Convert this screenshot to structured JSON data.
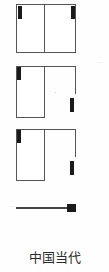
{
  "caption": {
    "text": "中国当代"
  },
  "colors": {
    "line": "#555555",
    "hardware": "#1a1a1a",
    "background": "#ffffff",
    "caption_text": "#2b2b2b"
  },
  "figures": [
    {
      "id": "figure-1",
      "kind": "double-leaf-frame",
      "label": "",
      "x": 16,
      "y": 4,
      "width": 60,
      "height": 49,
      "divider": true,
      "hardware": [
        {
          "name": "hinge-top-left",
          "x": 1,
          "y": 1,
          "width": 4,
          "height": 13
        },
        {
          "name": "hinge-top-right",
          "x": 54,
          "y": 1,
          "width": 4,
          "height": 13
        }
      ]
    },
    {
      "id": "figure-2",
      "kind": "single-leaf-open-right",
      "label": "",
      "x": 16,
      "y": 66,
      "width": 60,
      "height": 52,
      "divider": false,
      "hardware": [
        {
          "name": "hinge-top-left",
          "x": 1,
          "y": 1,
          "width": 4,
          "height": 13
        },
        {
          "name": "handle-mid-right",
          "x": 54,
          "y": 32,
          "width": 4,
          "height": 14
        }
      ]
    },
    {
      "id": "figure-3",
      "kind": "single-leaf-open-right",
      "label": "",
      "x": 16,
      "y": 129,
      "width": 60,
      "height": 52,
      "divider": false,
      "hardware": [
        {
          "name": "hinge-top-left",
          "x": 1,
          "y": 1,
          "width": 4,
          "height": 13
        },
        {
          "name": "handle-mid-right",
          "x": 54,
          "y": 32,
          "width": 4,
          "height": 14
        }
      ]
    }
  ],
  "slider": {
    "name": "scale-bar",
    "track": {
      "x": 16,
      "y": 207,
      "width": 60,
      "height": 2
    },
    "handle": {
      "x": 67,
      "y": 204,
      "width": 9,
      "height": 8
    },
    "value_label": ""
  }
}
